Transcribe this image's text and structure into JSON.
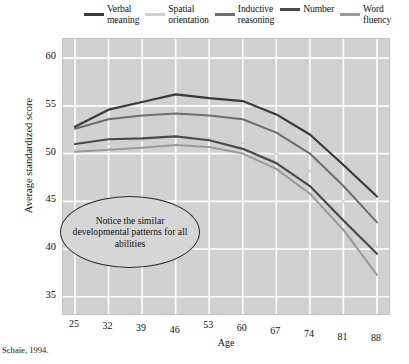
{
  "caption": "Schaie, 1994.",
  "annotation": "Notice the similar\ndevelopmental patterns\nfor all abilities",
  "legend": [
    {
      "label": "Verbal\nmeaning",
      "color": "#3a3a3a"
    },
    {
      "label": "Spatial\norientation",
      "color": "#cfcfcf"
    },
    {
      "label": "Inductive\nreasoning",
      "color": "#6e6e6e"
    },
    {
      "label": "Number",
      "color": "#4a4a4a"
    },
    {
      "label": "Word\nfluency",
      "color": "#9a9a9a"
    }
  ],
  "chart_data": {
    "type": "line",
    "title": "",
    "xlabel": "Age",
    "ylabel": "Average standardized score",
    "x": [
      25,
      32,
      39,
      46,
      53,
      60,
      67,
      74,
      81,
      88
    ],
    "categories": [
      "25",
      "32",
      "39",
      "46",
      "53",
      "60",
      "67",
      "74",
      "81",
      "88"
    ],
    "xticklabels": [
      "25",
      "32",
      "39",
      "46",
      "53",
      "60",
      "67",
      "74",
      "81",
      "88"
    ],
    "yticklabels": [
      "35",
      "40",
      "45",
      "50",
      "55",
      "60"
    ],
    "yticks": [
      35,
      40,
      45,
      50,
      55,
      60
    ],
    "ylim": [
      33.2,
      62.0
    ],
    "xlim": [
      22.5,
      90.5
    ],
    "grid": true,
    "legend_position": "above-plot",
    "series": [
      {
        "name": "Verbal meaning",
        "color": "#3a3a3a",
        "width": 2.2,
        "values": [
          52.8,
          54.6,
          55.4,
          56.2,
          55.8,
          55.5,
          54.1,
          52.0,
          48.8,
          45.5
        ]
      },
      {
        "name": "Spatial orientation",
        "color": "#cfcfcf",
        "width": 1.9,
        "values": [
          50.4,
          51.0,
          51.4,
          51.8,
          51.6,
          51.1,
          50.0,
          48.2,
          45.0,
          40.2
        ]
      },
      {
        "name": "Inductive reasoning",
        "color": "#6e6e6e",
        "width": 2.0,
        "values": [
          52.6,
          53.6,
          54.0,
          54.2,
          54.0,
          53.6,
          52.2,
          50.0,
          46.6,
          42.8
        ]
      },
      {
        "name": "Number",
        "color": "#4a4a4a",
        "width": 2.2,
        "values": [
          51.0,
          51.5,
          51.6,
          51.8,
          51.4,
          50.5,
          49.0,
          46.6,
          43.0,
          39.5
        ]
      },
      {
        "name": "Word fluency",
        "color": "#9a9a9a",
        "width": 2.0,
        "values": [
          50.2,
          50.4,
          50.6,
          50.9,
          50.7,
          50.0,
          48.4,
          45.8,
          42.0,
          37.3
        ]
      }
    ]
  }
}
